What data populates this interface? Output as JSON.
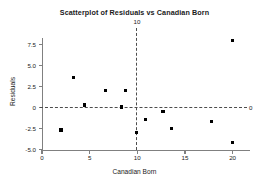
{
  "chart_data": {
    "type": "scatter",
    "title": "Scatterplot of Residuals vs Canadian Born",
    "xlabel": "Canadian Born",
    "ylabel": "Residuals",
    "xlim": [
      0,
      21.8
    ],
    "ylim": [
      -5.0,
      8.6
    ],
    "grid": false,
    "legend": null,
    "xticks": [
      "0",
      "5",
      "10",
      "15",
      "20"
    ],
    "xtick_values": [
      0,
      5,
      10,
      15,
      20
    ],
    "yticks": [
      "7.5",
      "5.0",
      "2.5",
      "0",
      "-2.5",
      "-5.0"
    ],
    "ytick_values": [
      7.5,
      5.0,
      2.5,
      0,
      -2.5,
      -5.0
    ],
    "reference_lines": [
      {
        "name": "vertical-reference-line",
        "orientation": "vertical",
        "value": 10,
        "label": "10",
        "style": "dashed"
      },
      {
        "name": "horizontal-reference-line",
        "orientation": "horizontal",
        "value": 0,
        "label": "0",
        "style": "dashed"
      }
    ],
    "marker": {
      "shape": "square",
      "color": "#000000",
      "size": 3.2
    },
    "points": [
      {
        "x": 2.0,
        "y": -2.7
      },
      {
        "x": 3.3,
        "y": 3.6
      },
      {
        "x": 4.5,
        "y": 0.3
      },
      {
        "x": 6.7,
        "y": 2.0
      },
      {
        "x": 8.3,
        "y": 0.05
      },
      {
        "x": 8.8,
        "y": 2.0
      },
      {
        "x": 9.9,
        "y": -3.0
      },
      {
        "x": 10.9,
        "y": -1.4
      },
      {
        "x": 12.7,
        "y": -0.45
      },
      {
        "x": 13.6,
        "y": -2.5
      },
      {
        "x": 17.8,
        "y": -1.7
      },
      {
        "x": 20.0,
        "y": 8.0
      },
      {
        "x": 20.0,
        "y": -4.2
      }
    ]
  }
}
